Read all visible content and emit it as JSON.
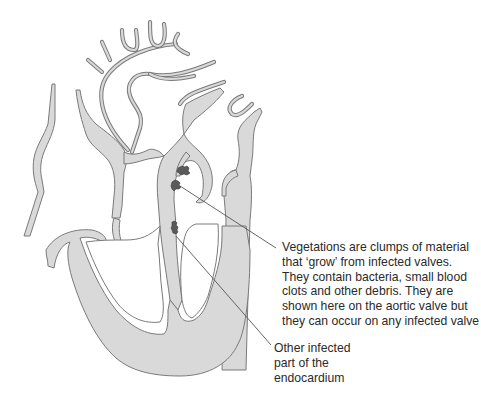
{
  "figure": {
    "fill_color": "#d9d9d9",
    "outline_color": "#7a7a7a",
    "vegetation_color": "#5a5a5a",
    "leader_color": "#555555",
    "text_color": "#2a2a2a"
  },
  "annotations": [
    {
      "id": "vegetations",
      "lines": [
        "Vegetations are clumps of material",
        "that ‘grow’ from infected valves.",
        "They contain bacteria, small blood",
        "clots and other debris. They are",
        "shown here on the aortic valve but",
        "they can occur on any infected valve"
      ],
      "points_to": "aortic valve vegetations"
    },
    {
      "id": "endocardium",
      "lines": [
        "Other infected",
        "part of the",
        "endocardium"
      ],
      "points_to": "septum endocardial vegetation"
    }
  ],
  "caption": {
    "text": "FIGURE 2.1  Infective endocarditis (cut off at bottom edge)"
  }
}
